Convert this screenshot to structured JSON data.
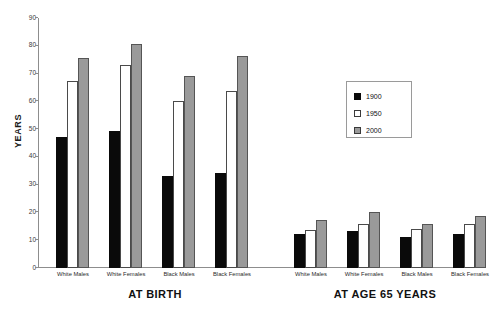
{
  "chart_data": {
    "type": "bar",
    "title": "",
    "xlabel": "",
    "ylabel": "YEARS",
    "ylim": [
      0,
      90
    ],
    "yticks": [
      0,
      10,
      20,
      30,
      40,
      50,
      60,
      70,
      80,
      90
    ],
    "grid": false,
    "legend_position": "center-right",
    "legend": [
      "1900",
      "1950",
      "2000"
    ],
    "categories": [
      "White Males",
      "White Females",
      "Black Males",
      "Black Females"
    ],
    "groups": [
      {
        "name": "AT BIRTH",
        "categories": [
          "White Males",
          "White Females",
          "Black Males",
          "Black Females"
        ],
        "series": [
          {
            "name": "1900",
            "values": [
              46.5,
              48.7,
              32.5,
              33.5
            ]
          },
          {
            "name": "1950",
            "values": [
              66.5,
              72.5,
              59.5,
              63.0
            ]
          },
          {
            "name": "2000",
            "values": [
              75.0,
              80.0,
              68.5,
              75.5
            ]
          }
        ]
      },
      {
        "name": "AT AGE 65 YEARS",
        "categories": [
          "White Males",
          "White Females",
          "Black Males",
          "Black Females"
        ],
        "series": [
          {
            "name": "1900",
            "values": [
              11.5,
              12.5,
              10.5,
              11.5
            ]
          },
          {
            "name": "1950",
            "values": [
              13.0,
              15.0,
              13.5,
              15.0
            ]
          },
          {
            "name": "2000",
            "values": [
              16.5,
              19.5,
              15.0,
              18.0
            ]
          }
        ]
      }
    ],
    "colors": {
      "1900": "#0a0a0a",
      "1950": "#ffffff",
      "2000": "#9a9a9a",
      "axis": "#8d8d8d",
      "text": "#111111"
    }
  }
}
